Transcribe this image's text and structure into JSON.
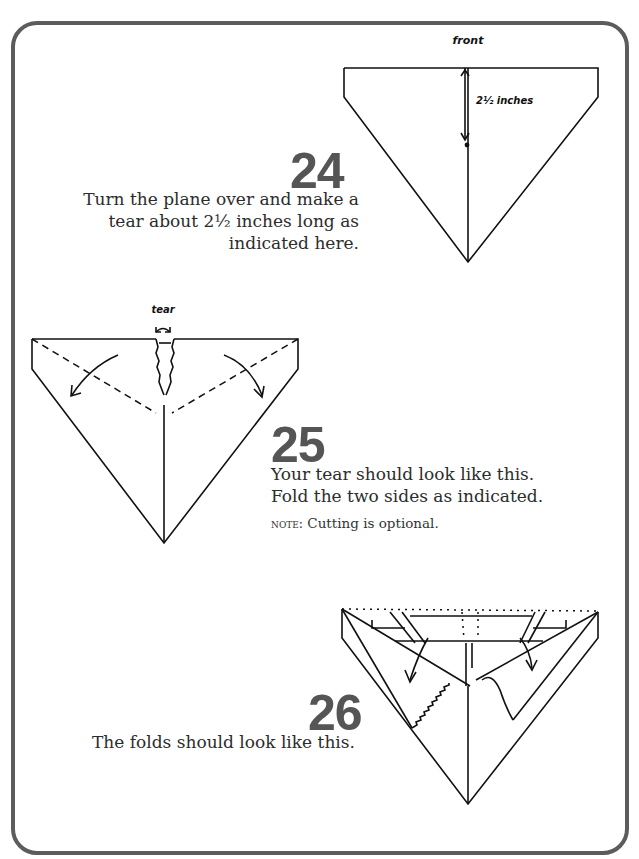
{
  "header": {
    "cut_off_text": "PLANE 11B"
  },
  "steps": [
    {
      "number": "24",
      "text_lines": [
        "Turn the plane over and make a",
        "tear about 2½ inches long as",
        "indicated here."
      ],
      "diagram": {
        "label_top": "front",
        "measure_label": "2½ inches"
      }
    },
    {
      "number": "25",
      "text_lines": [
        "Your tear should look like this.",
        "Fold the two sides as indicated."
      ],
      "note_prefix": "note:",
      "note_text": " Cutting is optional.",
      "diagram": {
        "label_top": "tear"
      }
    },
    {
      "number": "26",
      "text_lines": [
        "The folds should look like this."
      ],
      "diagram": {}
    }
  ],
  "colors": {
    "frame": "#5c5c5c",
    "step_number": "#555555",
    "text": "#2c2c2c",
    "line": "#111111"
  }
}
